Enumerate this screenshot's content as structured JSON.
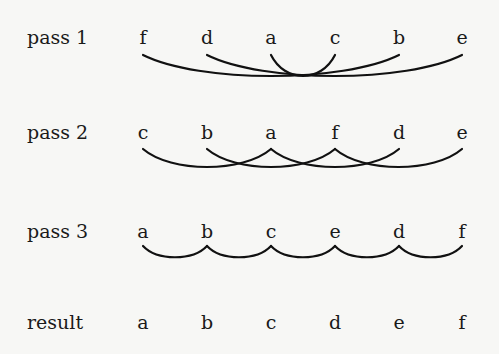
{
  "columns_x": [
    143,
    207,
    271,
    335,
    399,
    462
  ],
  "rows": [
    {
      "label": "pass 1",
      "top": 28,
      "letters": [
        "f",
        "d",
        "a",
        "c",
        "b",
        "e"
      ],
      "arcs": [
        [
          0,
          4
        ],
        [
          1,
          5
        ],
        [
          2,
          3
        ]
      ],
      "arc_top": 55,
      "arc_bottom": 81
    },
    {
      "label": "pass 2",
      "top": 123,
      "letters": [
        "c",
        "b",
        "a",
        "f",
        "d",
        "e"
      ],
      "arcs": [
        [
          0,
          2
        ],
        [
          1,
          3
        ],
        [
          2,
          4
        ],
        [
          3,
          5
        ]
      ],
      "arc_top": 149,
      "arc_bottom": 171
    },
    {
      "label": "pass 3",
      "top": 222,
      "letters": [
        "a",
        "b",
        "c",
        "e",
        "d",
        "f"
      ],
      "arcs": [
        [
          0,
          1
        ],
        [
          1,
          2
        ],
        [
          2,
          3
        ],
        [
          3,
          4
        ],
        [
          4,
          5
        ]
      ],
      "arc_top": 246,
      "arc_bottom": 259
    },
    {
      "label": "result",
      "top": 313,
      "letters": [
        "a",
        "b",
        "c",
        "d",
        "e",
        "f"
      ],
      "arcs": [],
      "arc_top": 0,
      "arc_bottom": 0
    }
  ]
}
